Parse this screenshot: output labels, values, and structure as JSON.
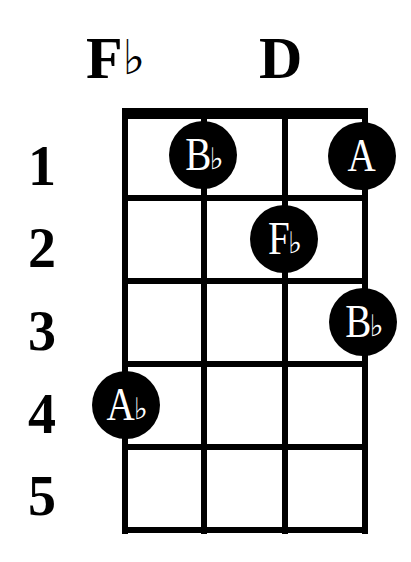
{
  "chord": {
    "left_label": {
      "letter": "F",
      "accidental": "♭"
    },
    "right_label": {
      "letter": "D",
      "accidental": ""
    }
  },
  "fret_numbers": [
    "1",
    "2",
    "3",
    "4",
    "5"
  ],
  "grid": {
    "strings": 4,
    "frets": 5,
    "nut": true
  },
  "notes": [
    {
      "string": 2,
      "fret": 1,
      "letter": "B",
      "accidental": "♭"
    },
    {
      "string": 4,
      "fret": 1,
      "letter": "A",
      "accidental": ""
    },
    {
      "string": 3,
      "fret": 2,
      "letter": "F",
      "accidental": "♭"
    },
    {
      "string": 4,
      "fret": 3,
      "letter": "B",
      "accidental": "♭"
    },
    {
      "string": 1,
      "fret": 4,
      "letter": "A",
      "accidental": "♭"
    }
  ],
  "colors": {
    "line": "#000000",
    "dot_fill": "#000000",
    "dot_text": "#ffffff",
    "background": "#ffffff"
  }
}
